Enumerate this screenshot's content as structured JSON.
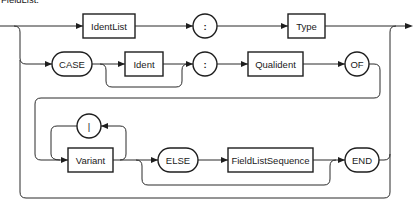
{
  "title": {
    "text": "FieldList:",
    "partially_visible": true
  },
  "diagram": {
    "type": "railroad-syntax-diagram",
    "row1": {
      "nonterminals": [
        "IdentList",
        "Type"
      ],
      "terminals": [
        ":"
      ]
    },
    "row2": {
      "terminals": [
        "CASE",
        ":",
        "OF"
      ],
      "nonterminals": [
        "Ident",
        "Qualident"
      ]
    },
    "row3": {
      "nonterminals": [
        "Variant",
        "FieldListSequence"
      ],
      "terminals": [
        "|",
        "ELSE",
        "END"
      ]
    },
    "labels": {
      "identlist": "IdentList",
      "colon1": ":",
      "type": "Type",
      "case": "CASE",
      "ident": "Ident",
      "colon2": ":",
      "qualident": "Qualident",
      "of": "OF",
      "bar": "|",
      "variant": "Variant",
      "else": "ELSE",
      "fieldlistsequence": "FieldListSequence",
      "end": "END"
    }
  },
  "colors": {
    "line": "#2a2a2a",
    "stroke": "#1e1e1e",
    "background": "#ffffff",
    "text": "#1a1a1a"
  }
}
